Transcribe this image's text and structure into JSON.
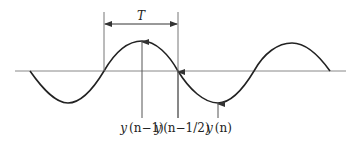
{
  "diagram": {
    "period_label": "T",
    "labels": {
      "y_n_minus_1": {
        "func": "y",
        "arg": "(n−1)"
      },
      "y_n_minus_half": {
        "func": "y",
        "arg": "(n−1/2)"
      },
      "y_n": {
        "func": "y",
        "arg": "(n)"
      }
    },
    "colors": {
      "curve": "#222222",
      "axis": "#888888",
      "guide": "#777777"
    }
  }
}
